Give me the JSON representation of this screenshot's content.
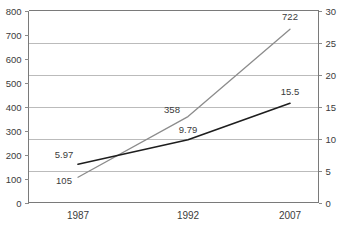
{
  "chart_data": {
    "type": "line",
    "title": "",
    "subtitle": "",
    "xlabel": "",
    "ylabel": "",
    "categories": [
      "1987",
      "1992",
      "2007"
    ],
    "grid": true,
    "grid_axis": "secondary",
    "legend": "none",
    "axes": {
      "primary": {
        "side": "left",
        "ylim": [
          0,
          800
        ],
        "tick_step": 100,
        "ticks": [
          "0",
          "100",
          "200",
          "300",
          "400",
          "500",
          "600",
          "700",
          "800"
        ]
      },
      "secondary": {
        "side": "right",
        "ylim": [
          0,
          30
        ],
        "tick_step": 5,
        "ticks": [
          "0",
          "5",
          "10",
          "15",
          "20",
          "25",
          "30"
        ]
      }
    },
    "series": [
      {
        "name": "series-primary-gray",
        "axis": "primary",
        "color": "#8c8c8c",
        "stroke_width": 1.3,
        "values": [
          105,
          358,
          722
        ],
        "labels": [
          "105",
          "358",
          "722"
        ]
      },
      {
        "name": "series-secondary-dark",
        "axis": "secondary",
        "color": "#1e1e1e",
        "stroke_width": 1.6,
        "values": [
          5.97,
          9.79,
          15.5
        ],
        "labels": [
          "5.97",
          "9.79",
          "15.5"
        ]
      }
    ]
  },
  "colors": {
    "background": "#ffffff",
    "gridline": "#b4b4b4",
    "axis": "#7a7a7a",
    "text": "#3b3b3b",
    "series_gray": "#8c8c8c",
    "series_dark": "#1e1e1e"
  }
}
